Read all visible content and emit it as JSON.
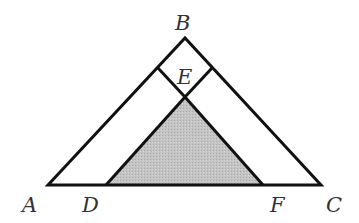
{
  "diagram": {
    "points": {
      "A": {
        "x": 48,
        "y": 185
      },
      "B": {
        "x": 185,
        "y": 38
      },
      "C": {
        "x": 321,
        "y": 185
      },
      "D": {
        "x": 106,
        "y": 185
      },
      "E": {
        "x": 185,
        "y": 97
      },
      "F": {
        "x": 263,
        "y": 185
      },
      "SqL": {
        "x": 158,
        "y": 68
      },
      "SqR": {
        "x": 212,
        "y": 68
      }
    },
    "labels": {
      "A": "A",
      "B": "B",
      "C": "C",
      "D": "D",
      "E": "E",
      "F": "F"
    },
    "colors": {
      "stroke": "#111111",
      "shade": "#bdbdbd",
      "label": "#333333"
    }
  }
}
